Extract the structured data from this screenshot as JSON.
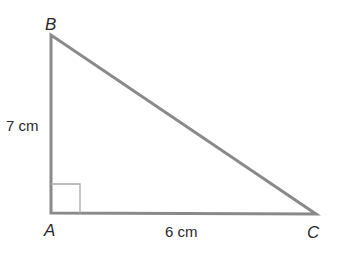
{
  "diagram": {
    "type": "right-triangle",
    "stroke_color": "#8a8a8a",
    "square_color": "#a8a8a8",
    "text_color": "#2a2a2a",
    "vertices": [
      {
        "label": "B",
        "x": 51,
        "y": 35
      },
      {
        "label": "A",
        "x": 51,
        "y": 213
      },
      {
        "label": "C",
        "x": 316,
        "y": 214
      }
    ],
    "sides": [
      {
        "between": "AB",
        "measurement": "7 cm"
      },
      {
        "between": "AC",
        "measurement": "6 cm"
      }
    ],
    "right_angle_at": "A"
  }
}
